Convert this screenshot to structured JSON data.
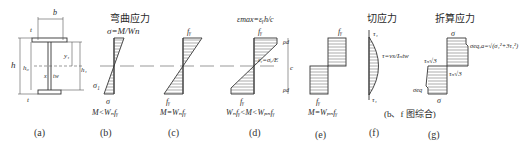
{
  "figure": {
    "section": {
      "labels": {
        "b": "b",
        "t_top": "t",
        "t_bot": "t",
        "h": "h",
        "h0": "h₀",
        "y1": "y₁",
        "h1": "h₁",
        "x": "x",
        "tw": "tw"
      },
      "caption": "(a)"
    },
    "bending": {
      "title": "弯曲应力",
      "top_label": "σ=M/Wn",
      "sigma1_label": "σ₁",
      "bottom_label": "σ",
      "condition": "M<Wₙfᵧ",
      "caption": "(b)"
    },
    "elastic_limit": {
      "top_label": "fᵧ",
      "bottom_label": "fᵧ",
      "condition": "M=Wₙfᵧ",
      "caption": "(c)"
    },
    "elasto_plastic": {
      "strain_label": "εmax=εᵧh/c",
      "top_label": "fᵧ",
      "mid_label": "εᵧ=σᵧ/E",
      "dim_top": "ρd",
      "dim_mid": "c",
      "dim_bot": "ρd",
      "bottom_label": "fᵧ",
      "condition": "Wₙfᵧ<M<Wₚₙfᵧ",
      "caption": "(d)"
    },
    "plastic": {
      "top_label": "fᵧ",
      "bottom_label": "fᵧ",
      "condition": "M=Wₚₙfᵧ",
      "caption": "(e)"
    },
    "shear": {
      "title": "切应力",
      "top_label": "τ₁",
      "formula": "τ=vs/Iₙtw",
      "bottom_label": "τ₁",
      "caption": "(f)"
    },
    "equivalent": {
      "title": "折算应力",
      "top_label": "σ",
      "eq_label": "σeq,a=√(σ₁²+3τ₁²)",
      "tau_left": "τₙ√3",
      "tau_right": "τₙ√3",
      "eq_bottom": "σeq",
      "bottom_label": "σ",
      "note": "(b、f 图综合)",
      "caption": "(g)"
    }
  }
}
